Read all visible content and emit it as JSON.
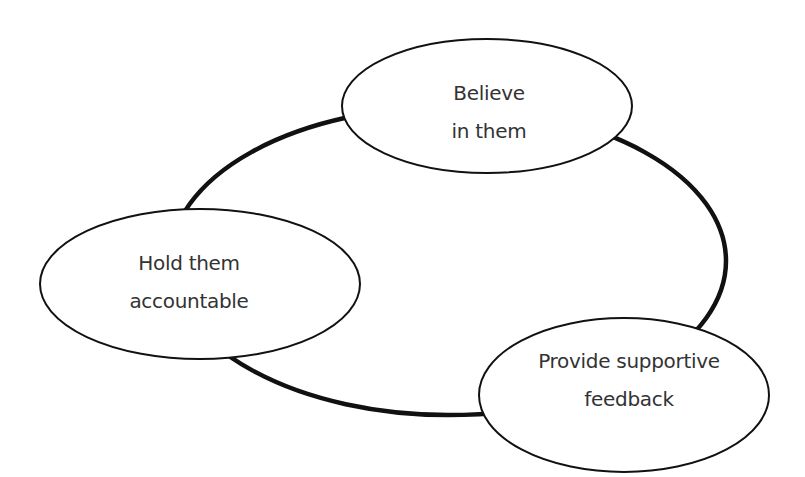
{
  "diagram": {
    "type": "cycle",
    "colors": {
      "stroke": "#111111",
      "text": "#333333",
      "background": "#ffffff",
      "node_fill": "#ffffff"
    },
    "nodes": [
      {
        "id": "believe",
        "line1": "Believe",
        "line2": "in them"
      },
      {
        "id": "feedback",
        "line1": "Provide supportive",
        "line2": "feedback"
      },
      {
        "id": "accountable",
        "line1": "Hold them",
        "line2": "accountable"
      }
    ]
  }
}
